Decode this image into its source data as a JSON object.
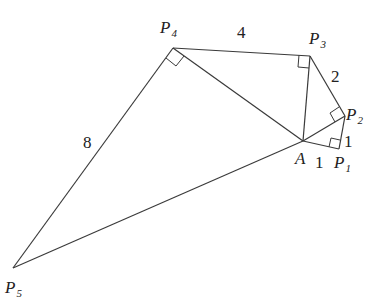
{
  "diagram": {
    "title": "",
    "points": {
      "A": {
        "label": "A",
        "sub": "",
        "x": 303,
        "y": 141
      },
      "P1": {
        "label": "P",
        "sub": "1",
        "x": 339,
        "y": 149
      },
      "P2": {
        "label": "P",
        "sub": "2",
        "x": 345,
        "y": 116
      },
      "P3": {
        "label": "P",
        "sub": "3",
        "x": 310,
        "y": 56
      },
      "P4": {
        "label": "P",
        "sub": "4",
        "x": 173,
        "y": 48
      },
      "P5": {
        "label": "P",
        "sub": "5",
        "x": 13,
        "y": 268
      }
    },
    "segment_labels": {
      "AP1": "1",
      "P1P2": "1",
      "P2P3": "2",
      "P3P4": "4",
      "P4P5": "8"
    },
    "right_angles": [
      "P1",
      "P2",
      "P3",
      "P4"
    ]
  }
}
